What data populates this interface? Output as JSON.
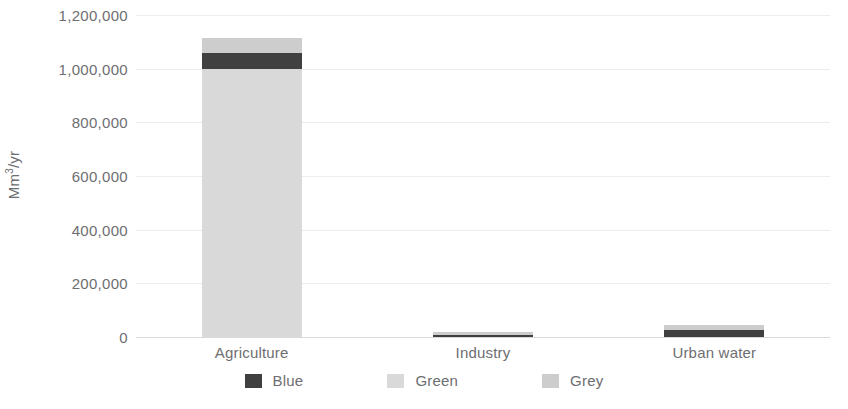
{
  "chart_data": {
    "type": "bar",
    "subtype": "stacked-bar",
    "title": "",
    "subtitle": "",
    "xlabel": "",
    "ylabel": "Mm3/yr",
    "ylabel_display": "Mm",
    "ylabel_sup": "3",
    "ylabel_tail": "/yr",
    "categories": [
      "Agriculture",
      "Industry",
      "Urban water"
    ],
    "series": [
      {
        "name": "Blue",
        "color": "#404040",
        "values": [
          60000,
          6000,
          26000
        ]
      },
      {
        "name": "Green",
        "color": "#d9d9d9",
        "values": [
          1000000,
          0,
          0
        ]
      },
      {
        "name": "Grey",
        "color": "#cdcdcd",
        "values": [
          55000,
          12000,
          19000
        ]
      }
    ],
    "stack_order": [
      "Green",
      "Blue",
      "Grey"
    ],
    "totals": [
      1115000,
      18000,
      45000
    ],
    "ylim": [
      0,
      1200000
    ],
    "ytick_step": 200000,
    "ytick_labels": [
      "0",
      "200,000",
      "400,000",
      "600,000",
      "800,000",
      "1,000,000",
      "1,200,000"
    ],
    "ytick_values": [
      0,
      200000,
      400000,
      600000,
      800000,
      1000000,
      1200000
    ],
    "grid": true,
    "grid_color": "#ededed",
    "axis_line_color": "#d9d9d9",
    "legend_position": "bottom",
    "legend_entries": [
      "Blue",
      "Green",
      "Grey"
    ],
    "background": "#ffffff",
    "text_color": "#6d6e71"
  }
}
